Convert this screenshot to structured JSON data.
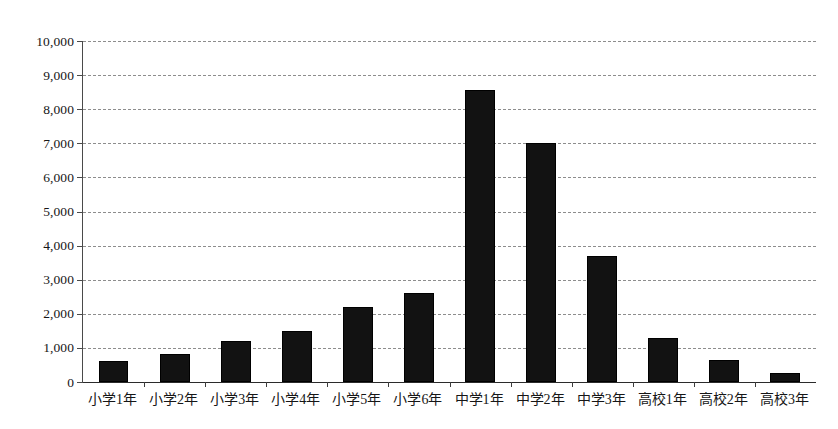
{
  "chart_data": {
    "type": "bar",
    "title": "",
    "subtitle": "",
    "xlabel": "",
    "ylabel": "",
    "categories": [
      "小学1年",
      "小学2年",
      "小学3年",
      "小学4年",
      "小学5年",
      "小学6年",
      "中学1年",
      "中学2年",
      "中学3年",
      "高校1年",
      "高校2年",
      "高校3年"
    ],
    "values": [
      620,
      830,
      1200,
      1500,
      2200,
      2600,
      8550,
      7000,
      3700,
      1280,
      660,
      250
    ],
    "ylim": [
      0,
      10000
    ],
    "ytick_step": 1000,
    "ytick_labels": [
      "10,000",
      "9,000",
      "8,000",
      "7,000",
      "6,000",
      "5,000",
      "4,000",
      "3,000",
      "2,000",
      "1,000",
      "0"
    ],
    "ytick_values": [
      10000,
      9000,
      8000,
      7000,
      6000,
      5000,
      4000,
      3000,
      2000,
      1000,
      0
    ],
    "grid": true,
    "grid_style": "dashed",
    "legend": false,
    "legend_position": "none",
    "series": [
      {
        "name": "",
        "color": "#121212",
        "values": [
          620,
          830,
          1200,
          1500,
          2200,
          2600,
          8550,
          7000,
          3700,
          1280,
          660,
          250
        ]
      }
    ],
    "colors": {
      "bar_fill": "#121212",
      "bar_border": "#000000",
      "gridline": "#8d8d8d",
      "axis": "#2b2b2b",
      "text": "#161616",
      "background": "#ffffff"
    }
  }
}
